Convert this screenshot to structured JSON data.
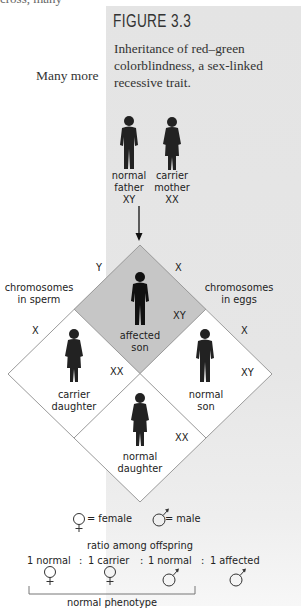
{
  "page": {
    "fragment_top": "cross, many",
    "fragment_left": "Many more"
  },
  "figure": {
    "label": "FIGURE 3.3",
    "caption": "Inheritance of red–green colorblindness, a sex-linked recessive trait.",
    "panel_color": "#e4e4e4",
    "affected_cell_color": "#c9c9c9"
  },
  "parents": {
    "father": {
      "line1": "normal",
      "line2": "father",
      "genotype": "XY"
    },
    "mother": {
      "line1": "carrier",
      "line2": "mother",
      "genotype": "XX"
    }
  },
  "punnett": {
    "left_axis_label_1": "chromosomes",
    "left_axis_label_2": "in sperm",
    "right_axis_label_1": "chromosomes",
    "right_axis_label_2": "in eggs",
    "sperm_top": "Y",
    "sperm_bottom": "X",
    "egg_top": "X",
    "egg_bottom": "X",
    "cells": [
      {
        "position": "top",
        "line1": "affected",
        "line2": "son",
        "genotype": "XY",
        "affected": true
      },
      {
        "position": "left",
        "line1": "carrier",
        "line2": "daughter",
        "genotype": "XX",
        "affected": false
      },
      {
        "position": "right",
        "line1": "normal",
        "line2": "son",
        "genotype": "XY",
        "affected": false
      },
      {
        "position": "bottom",
        "line1": "normal",
        "line2": "daughter",
        "genotype": "XX",
        "affected": false
      }
    ]
  },
  "legend": {
    "female": "= female",
    "male": "= male"
  },
  "ratio": {
    "title": "ratio among offspring",
    "items": [
      {
        "text": "1 normal",
        "sex": "female"
      },
      {
        "text": "1 carrier",
        "sex": "female"
      },
      {
        "text": "1 normal",
        "sex": "male"
      },
      {
        "text": "1 affected",
        "sex": "male"
      }
    ],
    "separator": ":",
    "bracket_label": "normal phenotype"
  }
}
